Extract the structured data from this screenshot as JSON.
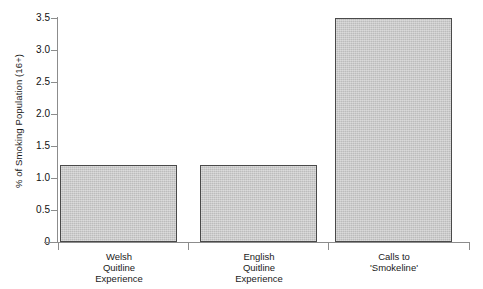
{
  "chart_data": {
    "type": "bar",
    "title": "",
    "subtitle": "",
    "xlabel": "",
    "ylabel": "% of Smoking Population (16+)",
    "categories": [
      "Welsh\nQuitline\nExperience",
      "English\nQuitline\nExperience",
      "Calls to\n'Smokeline'"
    ],
    "values": [
      1.2,
      1.2,
      3.5
    ],
    "ylim": [
      0,
      3.5
    ],
    "yticks": [
      0,
      0.5,
      1.0,
      1.5,
      2.0,
      2.5,
      3.0,
      3.5
    ],
    "ytick_labels": [
      "0",
      "0.5",
      "1.0",
      "1.5",
      "2.0",
      "2.5",
      "3.0",
      "3.5"
    ],
    "grid": false,
    "legend": false,
    "legend_position": "none",
    "bar_fill_color": "#bcbcbc",
    "bar_edge_color": "#4a4a4a",
    "axis_color": "#8c8c8c",
    "background_color": "#ffffff"
  }
}
